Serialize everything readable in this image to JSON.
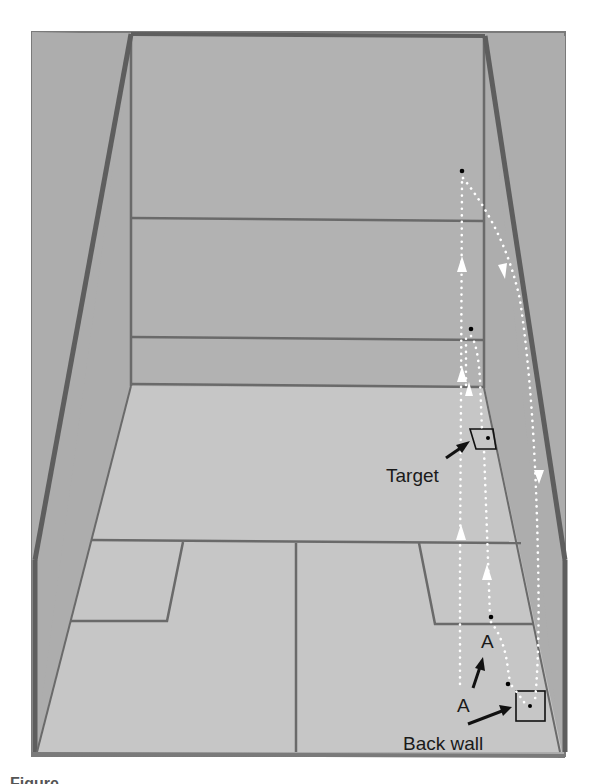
{
  "figure": {
    "labels": {
      "target": "Target",
      "back_wall": "Back wall",
      "position_a_upper": "A",
      "position_a_lower": "A"
    },
    "caption_partial": "Figure"
  },
  "colors": {
    "background": "#ffffff",
    "wall_fill": "#b4b4b4",
    "side_wall_fill": "#adadad",
    "floor_fill": "#c4c4c4",
    "line": "#6a6a6a",
    "edge": "#5e5e5e",
    "path_dots": "#ffffff",
    "ball": "#000000",
    "arrow": "#111111"
  }
}
